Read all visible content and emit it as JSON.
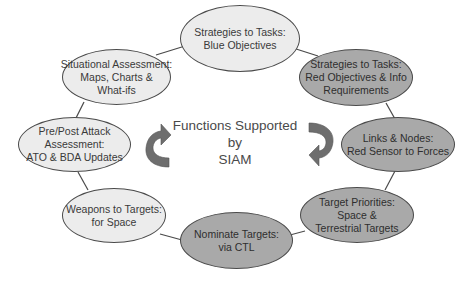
{
  "diagram": {
    "title_lines": [
      "Functions Supported",
      "by",
      "SIAM"
    ],
    "colors": {
      "light_node": "#ececec",
      "dark_node": "#a9a9a9",
      "border": "#4a4a4a",
      "arrow": "#6e6e6e"
    },
    "nodes": [
      {
        "id": "blue-objectives",
        "shade": "light",
        "lines": [
          "Strategies to Tasks:",
          "Blue Objectives"
        ]
      },
      {
        "id": "red-objectives",
        "shade": "dark",
        "lines": [
          "Strategies to Tasks:",
          "Red Objectives & Info",
          "Requirements"
        ]
      },
      {
        "id": "links-nodes",
        "shade": "dark",
        "lines": [
          "Links & Nodes:",
          "Red Sensor to Forces"
        ]
      },
      {
        "id": "target-priorities",
        "shade": "dark",
        "lines": [
          "Target Priorities:",
          "Space &",
          "Terrestrial Targets"
        ]
      },
      {
        "id": "nominate-targets",
        "shade": "dark",
        "lines": [
          "Nominate Targets:",
          "via CTL"
        ]
      },
      {
        "id": "weapons-to-targets",
        "shade": "light",
        "lines": [
          "Weapons to Targets:",
          "for Space"
        ]
      },
      {
        "id": "pre-post-attack",
        "shade": "light",
        "lines": [
          "Pre/Post Attack",
          "Assessment:",
          "ATO & BDA Updates"
        ]
      },
      {
        "id": "situational-assessment",
        "shade": "light",
        "lines": [
          "Situational Assessment:",
          "Maps, Charts &",
          "What-ifs"
        ]
      }
    ],
    "arrows": [
      {
        "id": "left-arrow",
        "direction": "counterclockwise-up"
      },
      {
        "id": "right-arrow",
        "direction": "clockwise-down"
      }
    ]
  }
}
